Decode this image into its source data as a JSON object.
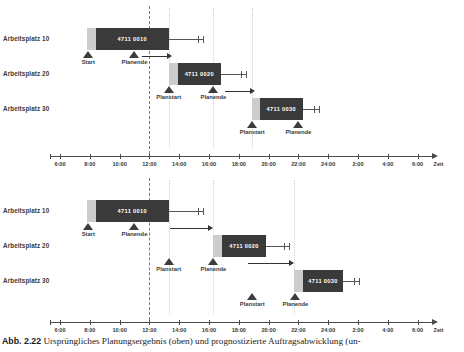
{
  "figure": {
    "caption_number": "Abb. 2.22",
    "caption_text": "Ursprüngliches Planungsergebnis (oben) und prognostizierte Auftragsabwicklung (un-"
  },
  "axis": {
    "title": "Zeit",
    "ticks": [
      "6:00",
      "8:00",
      "10:00",
      "12:00",
      "14:00",
      "16:00",
      "18:00",
      "20:00",
      "22:00",
      "24:00",
      "2:00",
      "4:00",
      "6:00"
    ],
    "tick_hours": [
      6,
      8,
      10,
      12,
      14,
      16,
      18,
      20,
      22,
      24,
      26,
      28,
      30
    ],
    "range_hours": [
      6,
      30.8
    ]
  },
  "labels": {
    "start": "Start",
    "planstart": "Planstart",
    "planende": "Planende"
  },
  "colors": {
    "work_bar": "#3a3a3a",
    "setup_bar": "#cdcdcd",
    "marker": "#3d3d3d",
    "axis": "#4a4a4a",
    "dashed_line": "#7a7a7a",
    "dotted_line": "#cfcfcf",
    "op_label": "#ffffff"
  },
  "chart_data": {
    "type": "bar",
    "xlabel": "Zeit",
    "ylabel": "",
    "xlim": [
      6,
      30.8
    ],
    "grid": false,
    "charts": [
      {
        "name": "Ursprüngliches Planungsergebnis",
        "position": "top",
        "now_line_hour": 12,
        "dotted_lines_hours": [
          13.3,
          16.3,
          18.9
        ],
        "rows": [
          {
            "resource": "Arbeitsplatz 10",
            "operation": "4711 0010",
            "setup_start": 7.8,
            "work_start": 8.4,
            "work_end": 13.3,
            "buffer_end": 15.6,
            "arrow": null,
            "markers": [
              {
                "label": "Start",
                "hour": 7.9
              },
              {
                "label": "Planende",
                "hour": 11.0
              }
            ]
          },
          {
            "resource": "Arbeitsplatz 20",
            "operation": "4711 0020",
            "setup_start": 13.3,
            "work_start": 13.9,
            "work_end": 16.8,
            "buffer_end": 18.5,
            "arrow": {
              "from": 11.5,
              "to": 13.5
            },
            "markers": [
              {
                "label": "Planstart",
                "hour": 13.3
              },
              {
                "label": "Planende",
                "hour": 16.3
              }
            ]
          },
          {
            "resource": "Arbeitsplatz 30",
            "operation": "4711 0030",
            "setup_start": 18.9,
            "work_start": 19.4,
            "work_end": 22.3,
            "buffer_end": 23.4,
            "arrow": {
              "from": 17.1,
              "to": 19.1
            },
            "markers": [
              {
                "label": "Planstart",
                "hour": 18.9
              },
              {
                "label": "Planende",
                "hour": 22.0
              }
            ]
          }
        ]
      },
      {
        "name": "Prognostizierte Auftragsabwicklung",
        "position": "bottom",
        "now_line_hour": 12,
        "dotted_lines_hours": [
          13.3,
          16.3,
          21.7
        ],
        "rows": [
          {
            "resource": "Arbeitsplatz 10",
            "operation": "4711 0010",
            "setup_start": 7.8,
            "work_start": 8.4,
            "work_end": 13.3,
            "buffer_end": 15.6,
            "arrow": null,
            "markers": [
              {
                "label": "Start",
                "hour": 7.9
              },
              {
                "label": "Planende",
                "hour": 11.0
              }
            ]
          },
          {
            "resource": "Arbeitsplatz 20",
            "operation": "4711 0020",
            "setup_start": 16.3,
            "work_start": 16.9,
            "work_end": 19.8,
            "buffer_end": 21.4,
            "arrow": {
              "from": 13.4,
              "to": 16.3
            },
            "markers": [
              {
                "label": "Planstart",
                "hour": 13.3
              },
              {
                "label": "Planende",
                "hour": 16.3
              }
            ]
          },
          {
            "resource": "Arbeitsplatz 30",
            "operation": "4711 0030",
            "setup_start": 21.7,
            "work_start": 22.3,
            "work_end": 25.0,
            "buffer_end": 26.1,
            "arrow": {
              "from": 18.6,
              "to": 21.7
            },
            "markers": [
              {
                "label": "Planstart",
                "hour": 18.9
              },
              {
                "label": "Planende",
                "hour": 21.8
              }
            ]
          }
        ]
      }
    ]
  }
}
